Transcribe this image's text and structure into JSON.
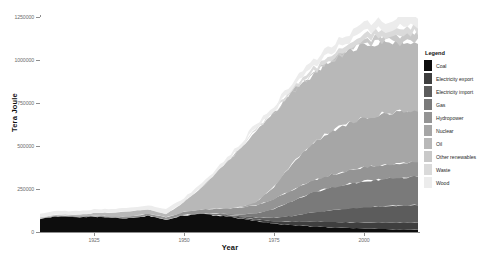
{
  "chart_data": {
    "type": "area",
    "title": "",
    "subtitle": "",
    "xlabel": "Year",
    "ylabel": "Tera Joule",
    "stacked": true,
    "grid": false,
    "legend_position": "right",
    "legend_title": "Legend",
    "xlim": [
      1910,
      2015
    ],
    "ylim": [
      0,
      1250000
    ],
    "xticks": [
      1925,
      1950,
      1975,
      2000
    ],
    "xtick_labels": [
      "1925",
      "1950",
      "1975",
      "2000"
    ],
    "yticks": [
      0,
      250000,
      500000,
      750000,
      1000000,
      1250000
    ],
    "ytick_labels": [
      "0",
      "250000",
      "500000",
      "750000",
      "1000000",
      "1250000"
    ],
    "x": [
      1910,
      1915,
      1920,
      1925,
      1930,
      1935,
      1940,
      1945,
      1950,
      1955,
      1960,
      1965,
      1970,
      1975,
      1980,
      1985,
      1990,
      1995,
      2000,
      2005,
      2010,
      2014
    ],
    "series": [
      {
        "name": "Coal",
        "color": "#0d0d0d",
        "values": [
          78000,
          92000,
          86000,
          90000,
          83000,
          80000,
          95000,
          72000,
          98000,
          104000,
          96000,
          82000,
          64000,
          48000,
          40000,
          34000,
          28000,
          24000,
          20000,
          17000,
          15000,
          14000
        ]
      },
      {
        "name": "Electricity export",
        "color": "#3f3f3f",
        "values": [
          0,
          0,
          0,
          0,
          0,
          0,
          0,
          0,
          1000,
          2000,
          3000,
          5000,
          9000,
          14000,
          19000,
          26000,
          30000,
          33000,
          36000,
          38000,
          40000,
          41000
        ]
      },
      {
        "name": "Electricity import",
        "color": "#5c5c5c",
        "values": [
          0,
          0,
          0,
          0,
          0,
          0,
          0,
          0,
          1000,
          2000,
          4000,
          7000,
          12000,
          21000,
          34000,
          52000,
          66000,
          78000,
          88000,
          94000,
          99000,
          101000
        ]
      },
      {
        "name": "Gas",
        "color": "#7a7a7a",
        "values": [
          0,
          0,
          0,
          0,
          0,
          0,
          0,
          0,
          0,
          1000,
          3000,
          8000,
          22000,
          52000,
          86000,
          112000,
          130000,
          142000,
          152000,
          158000,
          162000,
          164000
        ]
      },
      {
        "name": "Hydropower",
        "color": "#949494",
        "values": [
          3000,
          4000,
          5000,
          6000,
          8000,
          10000,
          12000,
          13000,
          17000,
          22000,
          29000,
          38000,
          48000,
          57000,
          64000,
          70000,
          74000,
          77000,
          80000,
          82000,
          83000,
          84000
        ]
      },
      {
        "name": "Nuclear",
        "color": "#a6a6a6",
        "values": [
          0,
          0,
          0,
          0,
          0,
          0,
          0,
          0,
          0,
          0,
          0,
          2000,
          20000,
          72000,
          150000,
          210000,
          250000,
          272000,
          288000,
          296000,
          300000,
          302000
        ]
      },
      {
        "name": "Oil",
        "color": "#b8b8b8",
        "values": [
          4000,
          6000,
          9000,
          14000,
          22000,
          30000,
          26000,
          18000,
          58000,
          130000,
          230000,
          330000,
          420000,
          430000,
          420000,
          400000,
          412000,
          420000,
          430000,
          420000,
          405000,
          398000
        ]
      },
      {
        "name": "Other renewables",
        "color": "#c9c9c9",
        "values": [
          0,
          0,
          0,
          0,
          0,
          0,
          0,
          0,
          0,
          0,
          0,
          0,
          1000,
          2000,
          4000,
          7000,
          11000,
          16000,
          24000,
          34000,
          44000,
          50000
        ]
      },
      {
        "name": "Waste",
        "color": "#dadada",
        "values": [
          0,
          0,
          0,
          0,
          0,
          0,
          0,
          0,
          1000,
          2000,
          3000,
          5000,
          8000,
          12000,
          17000,
          22000,
          27000,
          31000,
          35000,
          38000,
          40000,
          41000
        ]
      },
      {
        "name": "Wood",
        "color": "#ececec",
        "values": [
          22000,
          22000,
          21000,
          21000,
          20000,
          20000,
          24000,
          30000,
          22000,
          21000,
          21000,
          22000,
          24000,
          27000,
          31000,
          36000,
          40000,
          44000,
          48000,
          52000,
          56000,
          58000
        ]
      }
    ]
  },
  "axes": {
    "y_title": "Tera Joule",
    "x_title": "Year",
    "ytick_labels": [
      "1250000",
      "1000000",
      "750000",
      "500000",
      "250000",
      "0"
    ],
    "xtick_labels": [
      "1925",
      "1950",
      "1975",
      "2000"
    ]
  },
  "legend": {
    "title": "Legend",
    "items": [
      {
        "label": "Coal",
        "color": "#0d0d0d"
      },
      {
        "label": "Electricity export",
        "color": "#3f3f3f"
      },
      {
        "label": "Electricity import",
        "color": "#5c5c5c"
      },
      {
        "label": "Gas",
        "color": "#7a7a7a"
      },
      {
        "label": "Hydropower",
        "color": "#949494"
      },
      {
        "label": "Nuclear",
        "color": "#a6a6a6"
      },
      {
        "label": "Oil",
        "color": "#b8b8b8"
      },
      {
        "label": "Other renewables",
        "color": "#c9c9c9"
      },
      {
        "label": "Waste",
        "color": "#dadada"
      },
      {
        "label": "Wood",
        "color": "#ececec"
      }
    ]
  }
}
